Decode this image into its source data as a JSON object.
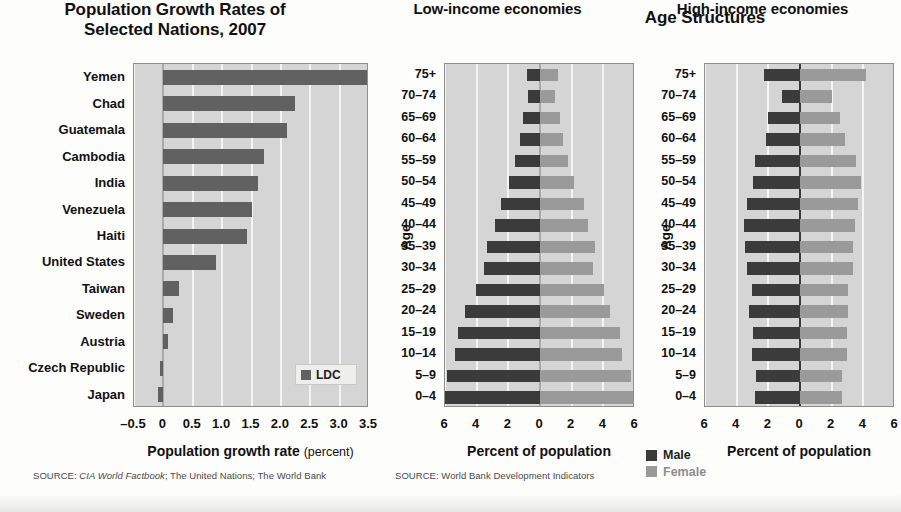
{
  "figure": {
    "group_title": "Age Structures"
  },
  "chart_data": [
    {
      "type": "bar",
      "orientation": "horizontal",
      "title": "Population Growth Rates of Selected Nations, 2007",
      "title_lines": [
        "Population Growth Rates of",
        "Selected Nations, 2007"
      ],
      "xlabel": "Population growth rate",
      "xlabel_unit": "(percent)",
      "ylabel": "",
      "xlim": [
        -0.5,
        3.5
      ],
      "xticks": [
        "-0.5",
        "0",
        "0.5",
        "1.0",
        "1.5",
        "2.0",
        "2.5",
        "3.0",
        "3.5"
      ],
      "xtick_values": [
        -0.5,
        0,
        0.5,
        1.0,
        1.5,
        2.0,
        2.5,
        3.0,
        3.5
      ],
      "grid": true,
      "legend": [
        "LDC"
      ],
      "legend_position": "bottom-right",
      "categories": [
        "Yemen",
        "Chad",
        "Guatemala",
        "Cambodia",
        "India",
        "Venezuela",
        "Haiti",
        "United States",
        "Taiwan",
        "Sweden",
        "Austria",
        "Czech Republic",
        "Japan"
      ],
      "values": [
        3.46,
        2.24,
        2.11,
        1.72,
        1.61,
        1.5,
        1.43,
        0.89,
        0.27,
        0.16,
        0.08,
        -0.06,
        -0.09
      ],
      "source": "SOURCE: CIA World Factbook; The United Nations; The World Bank",
      "source_prefix": "SOURCE: ",
      "source_italic": "CIA World Factbook",
      "source_rest": "; The United Nations; The World Bank"
    },
    {
      "type": "bar",
      "subtype": "population-pyramid",
      "title": "Low-income economies",
      "xlabel": "Percent of population",
      "ylabel": "Age",
      "xlim": [
        -6,
        6
      ],
      "xticks": [
        "6",
        "4",
        "2",
        "0",
        "2",
        "4",
        "6"
      ],
      "xtick_values": [
        -6,
        -4,
        -2,
        0,
        2,
        4,
        6
      ],
      "grid": true,
      "categories": [
        "75+",
        "70-74",
        "65-69",
        "60-64",
        "55-59",
        "50-54",
        "45-49",
        "40-44",
        "35-39",
        "30-34",
        "25-29",
        "20-24",
        "15-19",
        "10-14",
        "5-9",
        "0-4"
      ],
      "series": [
        {
          "name": "Male",
          "values": [
            0.85,
            0.75,
            1.05,
            1.25,
            1.55,
            1.95,
            2.45,
            2.85,
            3.35,
            3.55,
            4.05,
            4.75,
            5.15,
            5.35,
            5.85,
            6.05
          ]
        },
        {
          "name": "Female",
          "values": [
            1.15,
            0.95,
            1.25,
            1.45,
            1.75,
            2.15,
            2.75,
            3.05,
            3.45,
            3.35,
            4.05,
            4.45,
            5.05,
            5.15,
            5.75,
            5.95
          ]
        }
      ],
      "source": "SOURCE: World Bank Development Indicators",
      "source_prefix": "SOURCE: World Bank Development Indicators"
    },
    {
      "type": "bar",
      "subtype": "population-pyramid",
      "title": "High-income economies",
      "xlabel": "Percent of population",
      "ylabel": "Age",
      "xlim": [
        -6,
        6
      ],
      "xticks": [
        "6",
        "4",
        "2",
        "0",
        "2",
        "4",
        "6"
      ],
      "xtick_values": [
        -6,
        -4,
        -2,
        0,
        2,
        4,
        6
      ],
      "grid": true,
      "categories": [
        "75+",
        "70-74",
        "65-69",
        "60-64",
        "55-59",
        "50-54",
        "45-49",
        "40-44",
        "35-39",
        "30-34",
        "25-29",
        "20-24",
        "15-19",
        "10-14",
        "5-9",
        "0-4"
      ],
      "series": [
        {
          "name": "Male",
          "values": [
            2.25,
            1.15,
            2.05,
            2.15,
            2.85,
            2.95,
            3.35,
            3.55,
            3.45,
            3.35,
            3.05,
            3.25,
            2.95,
            3.05,
            2.75,
            2.85
          ]
        },
        {
          "name": "Female",
          "values": [
            4.15,
            2.05,
            2.55,
            2.85,
            3.55,
            3.85,
            3.65,
            3.45,
            3.35,
            3.35,
            3.05,
            3.05,
            2.95,
            2.95,
            2.65,
            2.65
          ]
        }
      ]
    }
  ],
  "pyramid_legend": {
    "male_label": "Male",
    "female_label": "Female",
    "male_color": "#3b3b3b",
    "female_color": "#9a9a9a"
  },
  "colors": {
    "ldc_bar": "#616161",
    "plot_background": "#d5d5d5",
    "gridline": "#f4f4f2",
    "page_background": "#fdfdfb"
  }
}
